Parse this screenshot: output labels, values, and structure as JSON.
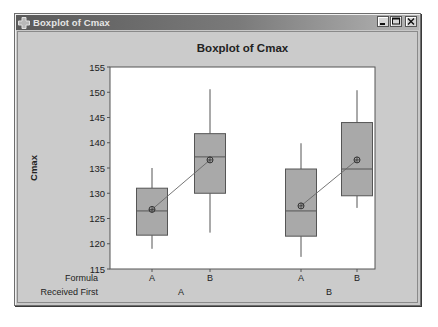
{
  "window": {
    "title": "Boxplot of Cmax",
    "buttons": {
      "minimize": "minimize-icon",
      "maximize": "maximize-icon",
      "close": "close-icon"
    }
  },
  "colors": {
    "box_fill": "#a9a9a9",
    "box_stroke": "#555555",
    "plot_bg": "#ffffff",
    "frame_bg": "#cbcbcb",
    "titlebar_start": "#5a5a5a",
    "titlebar_end": "#b5b5b5"
  },
  "chart_data": {
    "type": "boxplot",
    "title": "Boxplot of Cmax",
    "xlabel": "",
    "ylabel": "Cmax",
    "ylim": [
      115,
      155
    ],
    "yticks": [
      115,
      120,
      125,
      130,
      135,
      140,
      145,
      150,
      155
    ],
    "grid": false,
    "legend": null,
    "x_factor_labels": {
      "inner": "Formula",
      "outer": "Received First"
    },
    "groups": [
      {
        "received_first": "A",
        "boxes": [
          {
            "formula": "A",
            "whisker_low": 119,
            "q1": 121.7,
            "median": 126.5,
            "q3": 131,
            "whisker_high": 135,
            "mean": 126.8
          },
          {
            "formula": "B",
            "whisker_low": 122.2,
            "q1": 130,
            "median": 137.2,
            "q3": 141.8,
            "whisker_high": 150.6,
            "mean": 136.6
          }
        ]
      },
      {
        "received_first": "B",
        "boxes": [
          {
            "formula": "A",
            "whisker_low": 117.4,
            "q1": 121.5,
            "median": 126.5,
            "q3": 134.8,
            "whisker_high": 139.9,
            "mean": 127.5
          },
          {
            "formula": "B",
            "whisker_low": 127.1,
            "q1": 129.5,
            "median": 134.8,
            "q3": 144,
            "whisker_high": 150.4,
            "mean": 136.6
          }
        ]
      }
    ],
    "mean_connect_lines": true,
    "categories": [
      "A/A",
      "B/A",
      "A/B",
      "B/B"
    ]
  }
}
